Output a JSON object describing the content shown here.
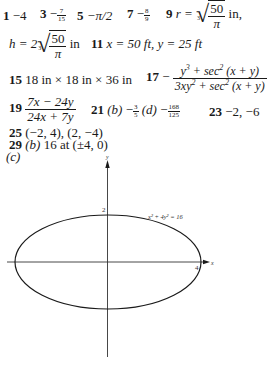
{
  "answers": {
    "a1": {
      "num": "1",
      "value": "−4"
    },
    "a3": {
      "num": "3",
      "sign": "−",
      "frac_n": "7",
      "frac_d": "15"
    },
    "a5": {
      "num": "5",
      "value": "−π/2"
    },
    "a7": {
      "num": "7",
      "sign": "−",
      "frac_n": "8",
      "frac_d": "9"
    },
    "a9": {
      "num": "9",
      "lhs": "r =",
      "root_index": "3",
      "frac_n": "50",
      "frac_d": "π",
      "unit": "in,",
      "lhs2": "h = 2",
      "root_index2": "3",
      "frac_n2": "50",
      "frac_d2": "π",
      "unit2": "in"
    },
    "a11": {
      "num": "11",
      "value": "x = 50 ft, y = 25 ft"
    },
    "a15": {
      "num": "15",
      "value": "18 in × 18 in × 36 in"
    },
    "a17": {
      "num": "17",
      "sign": "−",
      "numerator_a": "y",
      "numerator_a_sup": "3",
      "numerator_b": " + sec",
      "numerator_b_sup": "2",
      "numerator_c": " (x + y)",
      "denominator_a": "3xy",
      "denominator_a_sup": "2",
      "denominator_b": " + sec",
      "denominator_b_sup": "2",
      "denominator_c": " (x + y)"
    },
    "a19": {
      "num": "19",
      "frac_n": "7x − 24y",
      "frac_d": "24x + 7y"
    },
    "a21": {
      "num": "21",
      "part_b": "(b)",
      "sign_b": "−",
      "b_n": "3",
      "b_d": "5",
      "part_d": "(d)",
      "sign_d": "−",
      "d_n": "168",
      "d_d": "125"
    },
    "a23": {
      "num": "23",
      "value": "−2, −6"
    },
    "a25": {
      "num": "25",
      "value": "(−2, 4), (2, −4)"
    },
    "a29": {
      "num": "29",
      "part_b": "(b)",
      "value": "16 at (±4, 0)",
      "part_c": "(c)"
    }
  },
  "figure": {
    "x_axis_label": "x",
    "y_axis_label": "y",
    "x_intercept_label": "4",
    "y_intercept_label": "2",
    "curve_label": "x² + 4y² = 16",
    "colors": {
      "stroke": "#1a1a1a",
      "axis": "#333333"
    }
  }
}
